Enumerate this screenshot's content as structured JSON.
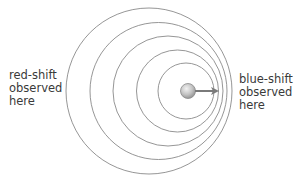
{
  "diagram": {
    "wavefront_color": "#8a8a8a",
    "wavefronts": [
      {
        "cx": 149,
        "cy": 91,
        "r": 83
      },
      {
        "cx": 158.5,
        "cy": 91,
        "r": 68.5
      },
      {
        "cx": 168,
        "cy": 91,
        "r": 55
      },
      {
        "cx": 177.5,
        "cy": 91,
        "r": 41
      },
      {
        "cx": 186,
        "cy": 91,
        "r": 28
      }
    ],
    "source": {
      "cx": 188,
      "cy": 91,
      "r": 7.5,
      "color": "#b8b8b8"
    },
    "motion_arrow": {
      "x1": 195,
      "y1": 91,
      "x2": 217,
      "y2": 91,
      "color": "#7a7a7a",
      "direction": "right"
    }
  },
  "labels": {
    "left": {
      "line1": "red-shift",
      "line2": "observed",
      "line3": "here"
    },
    "right": {
      "line1": "blue-shift",
      "line2": "observed",
      "line3": "here"
    }
  }
}
